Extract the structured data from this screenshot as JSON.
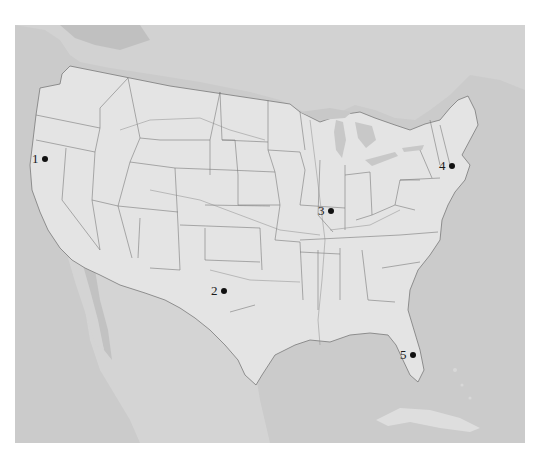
{
  "map": {
    "title": "",
    "region": "Contiguous United States with parts of Canada, Mexico and Cuba",
    "colors": {
      "water": "#c9c9c9",
      "land_us": "#e3e3e3",
      "land_foreign": "#d4d4d4",
      "borders": "#6e6e6e",
      "marker": "#111111"
    },
    "markers": [
      {
        "id": 1,
        "label": "1",
        "x": 42,
        "y": 161
      },
      {
        "id": 2,
        "label": "2",
        "x": 224,
        "y": 292
      },
      {
        "id": 3,
        "label": "3",
        "x": 331,
        "y": 212
      },
      {
        "id": 4,
        "label": "4",
        "x": 452,
        "y": 167
      },
      {
        "id": 5,
        "label": "5",
        "x": 413,
        "y": 356
      }
    ]
  }
}
